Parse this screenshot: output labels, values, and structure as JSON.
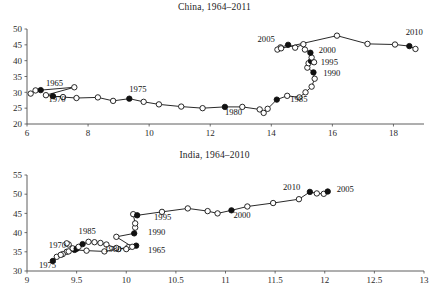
{
  "figure": {
    "background": "#ffffff",
    "ink_color": "#111111",
    "axis_color": "#4c4c4c"
  },
  "chart_data": [
    {
      "type": "line",
      "title": "China, 1964–2011",
      "xlabel": "",
      "ylabel": "",
      "xlim": [
        6,
        19
      ],
      "ylim": [
        20,
        50
      ],
      "xticks": [
        6,
        8,
        10,
        12,
        14,
        16,
        18
      ],
      "xticklabels": [
        "6",
        "8",
        "10",
        "12",
        "14",
        "16",
        "18"
      ],
      "yticks": [
        20,
        25,
        30,
        35,
        40,
        45,
        50
      ],
      "yticklabels": [
        "20",
        "25",
        "30",
        "35",
        "40",
        "45",
        "50"
      ],
      "grid": false,
      "legend": "none",
      "marker_open": "hollow circle (non-labelled years)",
      "marker_filled": "filled circle (labelled years, every 5 years)",
      "connected": true,
      "points": [
        {
          "year": 1964,
          "x": 6.12,
          "y": 29.6,
          "filled": false
        },
        {
          "year": 1965,
          "x": 6.28,
          "y": 30.6,
          "filled": false
        },
        {
          "year": 1966,
          "x": 6.45,
          "y": 30.7,
          "filled": true,
          "label": "1965"
        },
        {
          "year": 1967,
          "x": 7.55,
          "y": 31.6,
          "filled": false
        },
        {
          "year": 1968,
          "x": 6.62,
          "y": 29.1,
          "filled": false
        },
        {
          "year": 1969,
          "x": 6.85,
          "y": 28.8,
          "filled": true,
          "label": "1970"
        },
        {
          "year": 1970,
          "x": 7.18,
          "y": 28.5,
          "filled": false
        },
        {
          "year": 1971,
          "x": 7.62,
          "y": 28.2,
          "filled": false
        },
        {
          "year": 1972,
          "x": 8.32,
          "y": 28.4,
          "filled": false
        },
        {
          "year": 1973,
          "x": 8.82,
          "y": 27.3,
          "filled": false
        },
        {
          "year": 1974,
          "x": 9.35,
          "y": 28.0,
          "filled": true,
          "label": "1975"
        },
        {
          "year": 1975,
          "x": 9.82,
          "y": 27.0,
          "filled": false
        },
        {
          "year": 1976,
          "x": 10.32,
          "y": 26.2,
          "filled": false
        },
        {
          "year": 1977,
          "x": 11.05,
          "y": 25.5,
          "filled": false
        },
        {
          "year": 1978,
          "x": 11.75,
          "y": 25.0,
          "filled": false
        },
        {
          "year": 1979,
          "x": 12.48,
          "y": 25.4,
          "filled": true,
          "label": "1980"
        },
        {
          "year": 1980,
          "x": 13.05,
          "y": 25.4,
          "filled": false
        },
        {
          "year": 1981,
          "x": 13.62,
          "y": 24.6,
          "filled": false
        },
        {
          "year": 1982,
          "x": 13.75,
          "y": 23.5,
          "filled": false
        },
        {
          "year": 1983,
          "x": 13.88,
          "y": 24.8,
          "filled": false
        },
        {
          "year": 1984,
          "x": 14.18,
          "y": 27.7,
          "filled": true,
          "label": "1985"
        },
        {
          "year": 1985,
          "x": 14.52,
          "y": 28.9,
          "filled": false
        },
        {
          "year": 1986,
          "x": 14.92,
          "y": 28.4,
          "filled": false
        },
        {
          "year": 1987,
          "x": 15.12,
          "y": 30.0,
          "filled": false
        },
        {
          "year": 1988,
          "x": 15.32,
          "y": 31.8,
          "filled": false
        },
        {
          "year": 1989,
          "x": 15.42,
          "y": 34.3,
          "filled": false
        },
        {
          "year": 1990,
          "x": 15.38,
          "y": 36.3,
          "filled": true,
          "label": "1990"
        },
        {
          "year": 1991,
          "x": 15.18,
          "y": 37.8,
          "filled": false
        },
        {
          "year": 1992,
          "x": 15.22,
          "y": 39.2,
          "filled": false
        },
        {
          "year": 1993,
          "x": 15.3,
          "y": 39.9,
          "filled": true,
          "label": "1995"
        },
        {
          "year": 1994,
          "x": 15.4,
          "y": 39.5,
          "filled": false
        },
        {
          "year": 1995,
          "x": 15.32,
          "y": 41.0,
          "filled": false
        },
        {
          "year": 1996,
          "x": 15.28,
          "y": 42.5,
          "filled": true,
          "label": "2000"
        },
        {
          "year": 1997,
          "x": 15.1,
          "y": 43.5,
          "filled": false
        },
        {
          "year": 1998,
          "x": 15.05,
          "y": 45.2,
          "filled": false
        },
        {
          "year": 1999,
          "x": 14.78,
          "y": 44.1,
          "filled": false
        },
        {
          "year": 2000,
          "x": 14.55,
          "y": 45.0,
          "filled": true,
          "label": "2005"
        },
        {
          "year": 2001,
          "x": 14.3,
          "y": 44.2,
          "filled": false
        },
        {
          "year": 2002,
          "x": 14.2,
          "y": 43.5,
          "filled": false
        },
        {
          "year": 2003,
          "x": 14.32,
          "y": 43.9,
          "filled": false
        },
        {
          "year": 2004,
          "x": 16.15,
          "y": 47.9,
          "filled": false
        },
        {
          "year": 2005,
          "x": 17.15,
          "y": 45.3,
          "filled": false
        },
        {
          "year": 2006,
          "x": 18.05,
          "y": 45.1,
          "filled": false
        },
        {
          "year": 2007,
          "x": 18.52,
          "y": 44.6,
          "filled": true,
          "label": "2010"
        },
        {
          "year": 2008,
          "x": 18.72,
          "y": 43.7,
          "filled": false
        }
      ],
      "annotations": [
        {
          "text": "1965",
          "x": 6.62,
          "y": 31.9
        },
        {
          "text": "1970",
          "x": 6.7,
          "y": 27.1
        },
        {
          "text": "1975",
          "x": 9.35,
          "y": 30.0
        },
        {
          "text": "1980",
          "x": 12.48,
          "y": 23.0
        },
        {
          "text": "1985",
          "x": 14.62,
          "y": 26.9
        },
        {
          "text": "1990",
          "x": 15.7,
          "y": 35.2
        },
        {
          "text": "1995",
          "x": 15.62,
          "y": 38.5
        },
        {
          "text": "2000",
          "x": 15.55,
          "y": 42.4
        },
        {
          "text": "2005",
          "x": 13.55,
          "y": 45.9
        },
        {
          "text": "2010",
          "x": 18.4,
          "y": 48.0
        }
      ]
    },
    {
      "type": "line",
      "title": "India, 1964–2010",
      "xlabel": "",
      "ylabel": "",
      "xlim": [
        9,
        13
      ],
      "ylim": [
        30,
        55
      ],
      "xticks": [
        9,
        9.5,
        10,
        10.5,
        11,
        11.5,
        12,
        12.5,
        13
      ],
      "xticklabels": [
        "9",
        "9.5",
        "10",
        "10.5",
        "11",
        "11.5",
        "12",
        "12.5",
        "13"
      ],
      "yticks": [
        30,
        35,
        40,
        45,
        50,
        55
      ],
      "yticklabels": [
        "30",
        "35",
        "40",
        "45",
        "50",
        "55"
      ],
      "grid": false,
      "legend": "none",
      "marker_open": "hollow circle (non-labelled years)",
      "marker_filled": "filled circle (labelled years, every 5 years)",
      "connected": true,
      "points": [
        {
          "year": 1964,
          "x": 10.1,
          "y": 36.6,
          "filled": true,
          "label": "1965"
        },
        {
          "year": 1965,
          "x": 10.02,
          "y": 36.2,
          "filled": false
        },
        {
          "year": 1966,
          "x": 9.92,
          "y": 35.7,
          "filled": false
        },
        {
          "year": 1967,
          "x": 9.78,
          "y": 35.1,
          "filled": false
        },
        {
          "year": 1968,
          "x": 9.6,
          "y": 35.3,
          "filled": false
        },
        {
          "year": 1969,
          "x": 9.48,
          "y": 35.5,
          "filled": true,
          "label": "1970"
        },
        {
          "year": 1970,
          "x": 9.4,
          "y": 35.0,
          "filled": false
        },
        {
          "year": 1971,
          "x": 9.36,
          "y": 34.4,
          "filled": false
        },
        {
          "year": 1972,
          "x": 9.3,
          "y": 33.7,
          "filled": false
        },
        {
          "year": 1973,
          "x": 9.26,
          "y": 32.6,
          "filled": true,
          "label": "1975"
        },
        {
          "year": 1974,
          "x": 9.34,
          "y": 34.2,
          "filled": false
        },
        {
          "year": 1975,
          "x": 9.42,
          "y": 35.1,
          "filled": false
        },
        {
          "year": 1976,
          "x": 9.46,
          "y": 35.9,
          "filled": false
        },
        {
          "year": 1977,
          "x": 9.42,
          "y": 36.9,
          "filled": false
        },
        {
          "year": 1978,
          "x": 9.4,
          "y": 37.2,
          "filled": false
        },
        {
          "year": 1979,
          "x": 9.5,
          "y": 35.8,
          "filled": true,
          "label": "1980"
        },
        {
          "year": 1980,
          "x": 9.52,
          "y": 36.3,
          "filled": false
        },
        {
          "year": 1981,
          "x": 9.56,
          "y": 37.0,
          "filled": true,
          "label": "1985"
        },
        {
          "year": 1982,
          "x": 9.62,
          "y": 37.6,
          "filled": false
        },
        {
          "year": 1983,
          "x": 9.68,
          "y": 37.5,
          "filled": false
        },
        {
          "year": 1984,
          "x": 9.74,
          "y": 37.3,
          "filled": false
        },
        {
          "year": 1985,
          "x": 9.8,
          "y": 36.9,
          "filled": false
        },
        {
          "year": 1986,
          "x": 9.9,
          "y": 36.0,
          "filled": false
        },
        {
          "year": 1987,
          "x": 10.0,
          "y": 35.7,
          "filled": false
        },
        {
          "year": 1988,
          "x": 10.06,
          "y": 36.3,
          "filled": false
        },
        {
          "year": 1989,
          "x": 9.9,
          "y": 38.9,
          "filled": false
        },
        {
          "year": 1990,
          "x": 10.08,
          "y": 39.8,
          "filled": true,
          "label": "1990"
        },
        {
          "year": 1991,
          "x": 10.09,
          "y": 41.3,
          "filled": false
        },
        {
          "year": 1992,
          "x": 10.09,
          "y": 42.4,
          "filled": false
        },
        {
          "year": 1993,
          "x": 10.07,
          "y": 44.8,
          "filled": false
        },
        {
          "year": 1994,
          "x": 10.11,
          "y": 44.5,
          "filled": true,
          "label": "1995"
        },
        {
          "year": 1995,
          "x": 10.36,
          "y": 45.4,
          "filled": false
        },
        {
          "year": 1996,
          "x": 10.62,
          "y": 46.3,
          "filled": false
        },
        {
          "year": 1997,
          "x": 10.82,
          "y": 45.6,
          "filled": false
        },
        {
          "year": 1998,
          "x": 10.92,
          "y": 45.0,
          "filled": false
        },
        {
          "year": 1999,
          "x": 11.06,
          "y": 45.8,
          "filled": true,
          "label": "2000"
        },
        {
          "year": 2000,
          "x": 11.22,
          "y": 46.8,
          "filled": false
        },
        {
          "year": 2001,
          "x": 11.48,
          "y": 47.7,
          "filled": false
        },
        {
          "year": 2002,
          "x": 11.74,
          "y": 48.7,
          "filled": false
        },
        {
          "year": 2003,
          "x": 11.85,
          "y": 50.6,
          "filled": true,
          "label": "2010"
        },
        {
          "year": 2004,
          "x": 11.92,
          "y": 50.2,
          "filled": false
        },
        {
          "year": 2005,
          "x": 11.99,
          "y": 50.1,
          "filled": false
        },
        {
          "year": 2006,
          "x": 12.03,
          "y": 50.7,
          "filled": true,
          "label": "2005"
        }
      ],
      "annotations": [
        {
          "text": "1965",
          "x": 10.22,
          "y": 34.6
        },
        {
          "text": "1970",
          "x": 9.22,
          "y": 35.9
        },
        {
          "text": "1975",
          "x": 9.12,
          "y": 30.8
        },
        {
          "text": "1980",
          "x": 9.78,
          "y": 34.9
        },
        {
          "text": "1985",
          "x": 9.52,
          "y": 39.6
        },
        {
          "text": "1990",
          "x": 10.22,
          "y": 39.3
        },
        {
          "text": "1995",
          "x": 10.28,
          "y": 43.2
        },
        {
          "text": "2000",
          "x": 11.08,
          "y": 43.7
        },
        {
          "text": "2005",
          "x": 12.12,
          "y": 50.6
        },
        {
          "text": "2010",
          "x": 11.58,
          "y": 51.2
        }
      ]
    }
  ]
}
